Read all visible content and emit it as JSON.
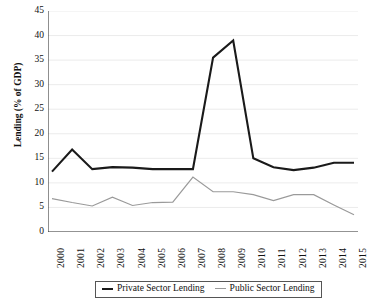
{
  "chart_data": {
    "type": "line",
    "title": "",
    "xlabel": "",
    "ylabel": "Lending (% of GDP)",
    "xlim": [
      2000,
      2015
    ],
    "ylim": [
      0,
      45
    ],
    "ytick_step": 5,
    "grid": true,
    "legend_position": "bottom",
    "categories": [
      "2000",
      "2001",
      "2002",
      "2003",
      "2004",
      "2005",
      "2006",
      "2007",
      "2008",
      "2009",
      "2010",
      "2011",
      "2012",
      "2013",
      "2014",
      "2015"
    ],
    "x": [
      2000,
      2001,
      2002,
      2003,
      2004,
      2005,
      2006,
      2007,
      2008,
      2009,
      2010,
      2011,
      2012,
      2013,
      2014,
      2015
    ],
    "yticks": [
      "0",
      "5",
      "10",
      "15",
      "20",
      "25",
      "30",
      "35",
      "40",
      "45"
    ],
    "series": [
      {
        "name": "Private Sector Lending",
        "color": "#1a1a1a",
        "width": 2.1,
        "values": [
          12.3,
          16.8,
          12.8,
          13.2,
          13.1,
          12.8,
          12.8,
          12.8,
          35.5,
          39.0,
          15.0,
          13.2,
          12.6,
          13.1,
          14.1,
          14.1
        ]
      },
      {
        "name": "Public Sector Lending",
        "color": "#9a9a9a",
        "width": 1.2,
        "values": [
          6.8,
          6.0,
          5.3,
          7.1,
          5.4,
          6.0,
          6.1,
          11.2,
          8.2,
          8.2,
          7.6,
          6.4,
          7.6,
          7.6,
          5.5,
          3.5
        ]
      }
    ]
  },
  "legend": {
    "private_label": "Private Sector Lending",
    "public_label": "Public Sector Lending"
  }
}
